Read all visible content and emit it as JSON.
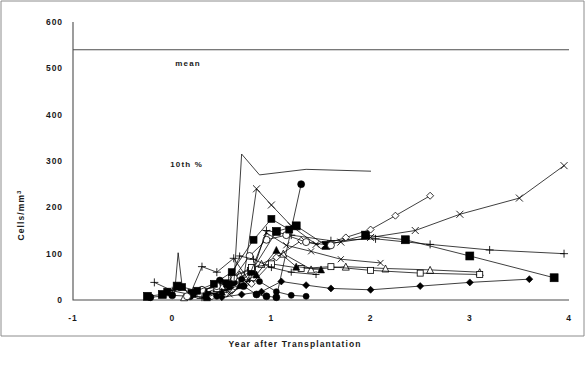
{
  "figure": {
    "background": "#ffffff",
    "frame_color": "#8c8c8c",
    "axis_color": "#4d4d4d",
    "series_color": "#000000"
  },
  "chart_data": {
    "type": "scatter",
    "title": "",
    "subtitle": "",
    "xlabel": "Year after Transplantation",
    "ylabel": "Cells/mm",
    "ylabel_superscript": "3",
    "xlim": [
      -1,
      4
    ],
    "ylim": [
      0,
      600
    ],
    "xticks": [
      -1,
      0,
      1,
      2,
      3,
      4
    ],
    "xticklabels": [
      "-1",
      "0",
      "1",
      "2",
      "3",
      "4"
    ],
    "yticks": [
      0,
      100,
      200,
      300,
      400,
      500,
      600
    ],
    "yticklabels": [
      "0",
      "100",
      "200",
      "300",
      "400",
      "500",
      "600"
    ],
    "grid": false,
    "legend": "none",
    "annotations": [
      {
        "text": "mean",
        "x": 0.03,
        "y": 505,
        "name": "mean-label"
      },
      {
        "text": "10th %",
        "x": -0.02,
        "y": 288,
        "name": "tenth-percentile-label"
      }
    ],
    "reference_lines": [
      {
        "name": "mean-line",
        "y": 540,
        "x_start": -1,
        "x_end": 4,
        "label": "mean"
      }
    ],
    "series": [
      {
        "name": "patient-01",
        "marker": "square-filled",
        "marker_size": 8,
        "points": [
          [
            -0.25,
            8
          ],
          [
            -0.1,
            12
          ],
          [
            0.05,
            30
          ],
          [
            0.2,
            14
          ],
          [
            0.35,
            10
          ],
          [
            0.55,
            35
          ],
          [
            0.8,
            62
          ],
          [
            1.05,
            148
          ],
          [
            1.25,
            160
          ],
          [
            1.55,
            118
          ],
          [
            1.95,
            140
          ],
          [
            2.35,
            130
          ],
          [
            3.0,
            95
          ],
          [
            3.85,
            48
          ]
        ]
      },
      {
        "name": "patient-02",
        "marker": "circle-filled",
        "marker_size": 7,
        "points": [
          [
            -0.22,
            6
          ],
          [
            0.0,
            10
          ],
          [
            0.18,
            8
          ],
          [
            0.32,
            18
          ],
          [
            0.48,
            42
          ],
          [
            0.62,
            38
          ],
          [
            0.72,
            30
          ],
          [
            0.85,
            12
          ],
          [
            0.95,
            8
          ],
          [
            1.05,
            6
          ],
          [
            1.3,
            250
          ]
        ]
      },
      {
        "name": "patient-03",
        "marker": "triangle-open",
        "marker_size": 7,
        "points": [
          [
            0.12,
            6
          ],
          [
            0.3,
            22
          ],
          [
            0.5,
            30
          ],
          [
            0.68,
            55
          ],
          [
            0.9,
            78
          ],
          [
            1.12,
            100
          ],
          [
            1.4,
            66
          ],
          [
            1.75,
            72
          ],
          [
            2.15,
            68
          ],
          [
            2.6,
            65
          ],
          [
            3.1,
            60
          ]
        ]
      },
      {
        "name": "patient-04",
        "marker": "x-cross",
        "marker_size": 7,
        "points": [
          [
            0.35,
            10
          ],
          [
            0.55,
            22
          ],
          [
            0.72,
            45
          ],
          [
            0.85,
            240
          ],
          [
            1.0,
            205
          ],
          [
            1.2,
            160
          ],
          [
            1.45,
            120
          ],
          [
            1.7,
            125
          ],
          [
            2.0,
            135
          ],
          [
            2.45,
            150
          ],
          [
            2.9,
            185
          ],
          [
            3.5,
            220
          ],
          [
            3.95,
            290
          ]
        ]
      },
      {
        "name": "patient-05",
        "marker": "plus",
        "marker_size": 8,
        "points": [
          [
            -0.18,
            38
          ],
          [
            0.0,
            20
          ],
          [
            0.18,
            12
          ],
          [
            0.3,
            72
          ],
          [
            0.45,
            60
          ],
          [
            0.62,
            90
          ],
          [
            0.78,
            40
          ],
          [
            0.95,
            150
          ],
          [
            1.2,
            140
          ],
          [
            1.6,
            128
          ],
          [
            2.05,
            132
          ],
          [
            2.6,
            120
          ],
          [
            3.2,
            108
          ],
          [
            3.95,
            100
          ]
        ]
      },
      {
        "name": "patient-06",
        "marker": "diamond-open",
        "marker_size": 7,
        "points": [
          [
            0.4,
            8
          ],
          [
            0.6,
            20
          ],
          [
            0.8,
            35
          ],
          [
            1.05,
            92
          ],
          [
            1.3,
            128
          ],
          [
            1.5,
            118
          ],
          [
            1.75,
            135
          ],
          [
            2.0,
            152
          ],
          [
            2.25,
            182
          ],
          [
            2.6,
            225
          ]
        ]
      },
      {
        "name": "patient-07",
        "marker": "diamond-filled",
        "marker_size": 7,
        "points": [
          [
            0.5,
            6
          ],
          [
            0.7,
            12
          ],
          [
            0.9,
            18
          ],
          [
            1.1,
            40
          ],
          [
            1.35,
            32
          ],
          [
            1.6,
            25
          ],
          [
            2.0,
            22
          ],
          [
            2.5,
            30
          ],
          [
            3.0,
            38
          ],
          [
            3.6,
            45
          ]
        ]
      },
      {
        "name": "patient-08",
        "marker": "square-open",
        "marker_size": 6,
        "points": [
          [
            0.28,
            10
          ],
          [
            0.45,
            25
          ],
          [
            0.6,
            48
          ],
          [
            0.8,
            70
          ],
          [
            1.0,
            78
          ],
          [
            1.3,
            68
          ],
          [
            1.6,
            72
          ],
          [
            2.0,
            64
          ],
          [
            2.5,
            58
          ],
          [
            3.1,
            55
          ]
        ]
      },
      {
        "name": "patient-09",
        "marker": "circle-open",
        "marker_size": 7,
        "points": [
          [
            0.15,
            8
          ],
          [
            0.3,
            22
          ],
          [
            0.45,
            30
          ],
          [
            0.62,
            48
          ],
          [
            0.78,
            95
          ],
          [
            0.95,
            130
          ],
          [
            1.15,
            140
          ],
          [
            1.35,
            125
          ],
          [
            1.6,
            118
          ]
        ]
      },
      {
        "name": "patient-10",
        "marker": "none",
        "marker_size": 5,
        "points": [
          [
            0.55,
            8
          ],
          [
            0.62,
            28
          ],
          [
            0.7,
            315
          ],
          [
            0.88,
            270
          ],
          [
            1.35,
            282
          ],
          [
            2.0,
            278
          ]
        ]
      },
      {
        "name": "patient-11",
        "marker": "plus",
        "marker_size": 7,
        "points": [
          [
            0.3,
            5
          ],
          [
            0.42,
            14
          ],
          [
            0.55,
            22
          ],
          [
            0.68,
            95
          ],
          [
            0.82,
            88
          ],
          [
            1.0,
            70
          ],
          [
            1.2,
            60
          ],
          [
            1.45,
            55
          ]
        ]
      },
      {
        "name": "patient-12",
        "marker": "triangle-filled",
        "marker_size": 7,
        "points": [
          [
            0.35,
            6
          ],
          [
            0.5,
            18
          ],
          [
            0.68,
            32
          ],
          [
            0.85,
            55
          ],
          [
            1.05,
            108
          ],
          [
            1.25,
            72
          ],
          [
            1.5,
            66
          ]
        ]
      },
      {
        "name": "patient-13",
        "marker": "none",
        "marker_size": 5,
        "points": [
          [
            0.02,
            5
          ],
          [
            0.06,
            102
          ],
          [
            0.1,
            30
          ],
          [
            0.16,
            14
          ],
          [
            0.24,
            8
          ],
          [
            0.35,
            6
          ]
        ]
      },
      {
        "name": "patient-14",
        "marker": "x-cross",
        "marker_size": 6,
        "points": [
          [
            0.58,
            12
          ],
          [
            0.75,
            38
          ],
          [
            0.95,
            145
          ],
          [
            1.15,
            118
          ],
          [
            1.4,
            105
          ],
          [
            1.7,
            88
          ],
          [
            2.1,
            80
          ]
        ]
      },
      {
        "name": "patient-15",
        "marker": "square-filled",
        "marker_size": 7,
        "points": [
          [
            -0.05,
            18
          ],
          [
            0.1,
            28
          ],
          [
            0.25,
            20
          ],
          [
            0.42,
            35
          ],
          [
            0.6,
            60
          ],
          [
            0.82,
            130
          ],
          [
            1.0,
            175
          ],
          [
            1.18,
            152
          ]
        ]
      },
      {
        "name": "patient-16",
        "marker": "circle-filled",
        "marker_size": 6,
        "points": [
          [
            0.45,
            8
          ],
          [
            0.58,
            28
          ],
          [
            0.7,
            45
          ],
          [
            0.88,
            40
          ],
          [
            1.05,
            18
          ],
          [
            1.2,
            10
          ],
          [
            1.35,
            8
          ]
        ]
      }
    ]
  }
}
